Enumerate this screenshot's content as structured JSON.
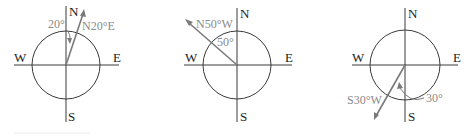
{
  "compass_labels": {
    "north": "N",
    "south": "S",
    "east": "E",
    "west": "W"
  },
  "diagrams": [
    {
      "bearing_label": "N20°E",
      "angle_label": "20°"
    },
    {
      "bearing_label": "N50°W",
      "angle_label": "50°"
    },
    {
      "bearing_label": "S30°W",
      "angle_label": "30°"
    }
  ],
  "colors": {
    "axes": "#3a3a3a",
    "bearing": "#7a7a7a",
    "labels": "#8a8a8a"
  }
}
